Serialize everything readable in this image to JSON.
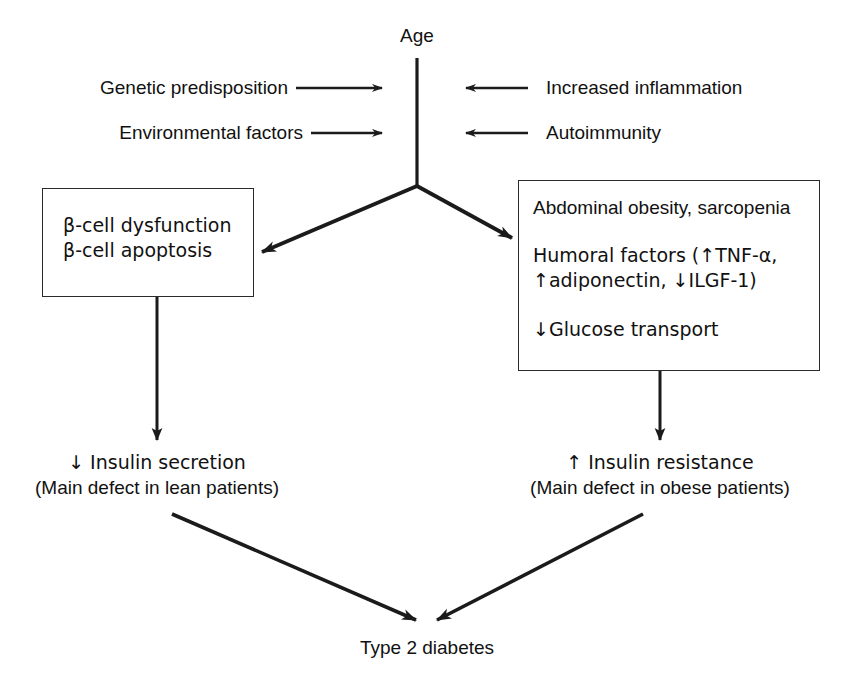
{
  "figure": {
    "root_label": "Age",
    "outcome_label": "Type 2 diabetes"
  },
  "left_inputs": [
    {
      "label": "Genetic predisposition",
      "arrow": "right-arrow-icon"
    },
    {
      "label": "Environmental factors",
      "arrow": "right-arrow-icon"
    }
  ],
  "right_inputs": [
    {
      "label": "Increased inflammation",
      "arrow": "left-arrow-icon"
    },
    {
      "label": "Autoimmunity",
      "arrow": "left-arrow-icon"
    }
  ],
  "left_box": {
    "lines": [
      "β-cell dysfunction",
      "β-cell apoptosis"
    ]
  },
  "right_box": {
    "lines": [
      "Abdominal obesity, sarcopenia",
      "Humoral factors (↑TNF-α,",
      "↑adiponectin, ↓ILGF-1)",
      "↓Glucose transport"
    ]
  },
  "left_outcome": {
    "line1": "↓ Insulin secretion",
    "line2": "(Main defect in lean patients)"
  },
  "right_outcome": {
    "line1": "↑ Insulin resistance",
    "line2": "(Main defect in obese patients)"
  },
  "style": {
    "stroke": "#1b1b1b",
    "background": "#ffffff",
    "text": "#111111"
  }
}
